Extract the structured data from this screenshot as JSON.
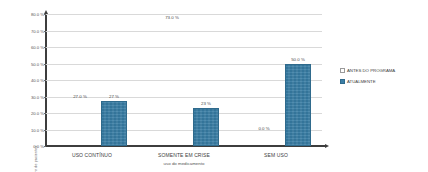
{
  "chart_data": {
    "type": "bar",
    "title": "",
    "subtitle": "",
    "xlabel": "uso do medicamento",
    "ylabel": "numero de pacientes",
    "categories": [
      "USO CONTÍNUO",
      "SOMENTE EM CRISE",
      "SEM USO"
    ],
    "series": [
      {
        "name": "ANTES DO PROGRAMA",
        "values": [
          27.0,
          73.0,
          0.0
        ],
        "labels": [
          "27.0 %",
          "73.0 %",
          "0.0 %"
        ],
        "color": "#ffffff"
      },
      {
        "name": "ATUALMENTE",
        "values": [
          27,
          23,
          50
        ],
        "labels": [
          "27 %",
          "23 %",
          "50.0 %"
        ],
        "color": "#3c7fa6"
      }
    ],
    "ylim": [
      0,
      80
    ],
    "yticks": [
      0,
      10,
      20,
      30,
      40,
      50,
      60,
      70,
      80
    ],
    "ytick_labels": [
      "0.0 %",
      "10.0 %",
      "20.0 %",
      "30.0 %",
      "40.0 %",
      "50.0 %",
      "60.0 %",
      "70.0 %",
      "80.0 %"
    ],
    "grid": true,
    "legend_position": "right"
  },
  "legend": {
    "items": [
      {
        "label": "ANTES DO PROGRAMA"
      },
      {
        "label": "ATUALMENTE"
      }
    ]
  }
}
